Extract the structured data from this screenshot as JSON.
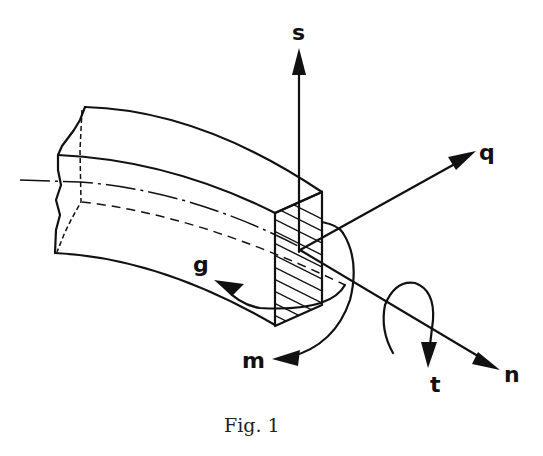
{
  "figure": {
    "caption": "Fig. 1",
    "labels": {
      "s": "s",
      "q": "q",
      "g": "g",
      "m": "m",
      "n": "n",
      "t": "t"
    }
  },
  "colors": {
    "ink": "#111111",
    "background": "#ffffff"
  }
}
